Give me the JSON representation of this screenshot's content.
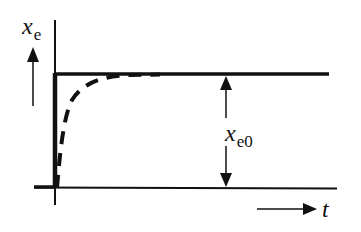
{
  "diagram": {
    "type": "step-response",
    "y_axis_label": {
      "symbol": "x",
      "subscript": "e"
    },
    "x_axis_label": "t",
    "amplitude_label": {
      "symbol": "x",
      "subscript": "e0"
    },
    "curves": [
      {
        "name": "ideal-step",
        "style": "solid-thick",
        "description": "instantaneous step to x_e0"
      },
      {
        "name": "actual-response",
        "style": "dashed-thick",
        "description": "exponential rise approaching x_e0"
      }
    ],
    "colors": {
      "ink": "#111111",
      "background": "#ffffff"
    }
  }
}
